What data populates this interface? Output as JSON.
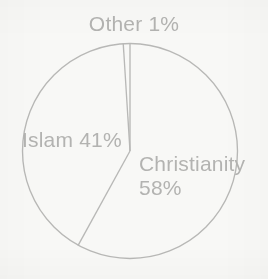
{
  "background_color": "#f8f8f6",
  "stroke_color": "#b8b8b6",
  "text_color": "#b3b3b1",
  "labels": {
    "other": "Other 1%",
    "islam": "Islam 41%",
    "christianity_name": "Christianity",
    "christianity_value": "58%"
  },
  "chart_data": {
    "type": "pie",
    "title": "",
    "subtitle": "",
    "xlabel": "",
    "ylabel": "",
    "legend": "none",
    "grid": false,
    "units": "percent",
    "total": 100,
    "start_angle_deg": 0,
    "direction": "clockwise",
    "categories": [
      "Christianity",
      "Islam",
      "Other"
    ],
    "values": [
      58,
      41,
      1
    ],
    "slices": [
      {
        "name": "Christianity",
        "value": 58,
        "label": "Christianity",
        "value_label": "58%",
        "fill": "none",
        "stroke": "#b8b8b6",
        "start_angle_deg": 3.6,
        "end_angle_deg": 212.4,
        "label_position": "inside-right"
      },
      {
        "name": "Islam",
        "value": 41,
        "label": "Islam",
        "value_label": "41%",
        "fill": "none",
        "stroke": "#b8b8b6",
        "start_angle_deg": 212.4,
        "end_angle_deg": 360.0,
        "label_position": "inside-left"
      },
      {
        "name": "Other",
        "value": 1,
        "label": "Other",
        "value_label": "1%",
        "fill": "none",
        "stroke": "#b8b8b6",
        "start_angle_deg": 0.0,
        "end_angle_deg": 3.6,
        "label_position": "outside-top"
      }
    ],
    "geometry": {
      "center_x": 130,
      "center_y": 151,
      "radius": 108
    }
  }
}
